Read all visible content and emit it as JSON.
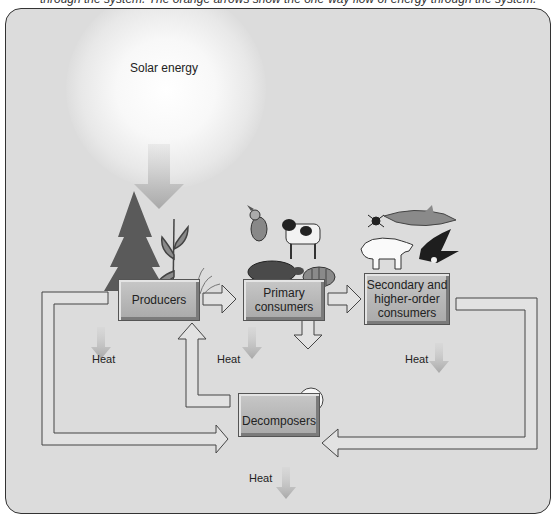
{
  "caption": "through the system. The orange arrows show the one-way flow of energy through the system.",
  "diagram": {
    "solar_label": "Solar energy",
    "nodes": {
      "producers": "Producers",
      "primary_line1": "Primary",
      "primary_line2": "consumers",
      "secondary_line1": "Secondary and",
      "secondary_line2": "higher-order",
      "secondary_line3": "consumers",
      "decomposers": "Decomposers"
    },
    "heat_labels": [
      "Heat",
      "Heat",
      "Heat",
      "Heat"
    ],
    "organisms": {
      "producers": [
        "tree-icon",
        "corn-plant-icon",
        "grass-icon"
      ],
      "primary_consumers": [
        "bird-icon",
        "cow-icon",
        "turtle-icon",
        "fish-icon"
      ],
      "secondary_consumers": [
        "spider-icon",
        "shark-icon",
        "polar-bear-icon",
        "eagle-icon"
      ],
      "decomposers": [
        "worm-icon",
        "mushroom-icon",
        "bacteria-icon"
      ]
    },
    "flows": [
      {
        "from": "solar",
        "to": "producers",
        "type": "energy"
      },
      {
        "from": "producers",
        "to": "primary_consumers",
        "type": "matter"
      },
      {
        "from": "primary_consumers",
        "to": "secondary_consumers",
        "type": "matter"
      },
      {
        "from": "primary_consumers",
        "to": "decomposers",
        "type": "matter"
      },
      {
        "from": "producers",
        "to": "decomposers",
        "type": "matter"
      },
      {
        "from": "secondary_consumers",
        "to": "decomposers",
        "type": "matter"
      },
      {
        "from": "decomposers",
        "to": "producers",
        "type": "matter"
      },
      {
        "from": "producers",
        "to": "heat",
        "type": "energy"
      },
      {
        "from": "primary_consumers",
        "to": "heat",
        "type": "energy"
      },
      {
        "from": "secondary_consumers",
        "to": "heat",
        "type": "energy"
      },
      {
        "from": "decomposers",
        "to": "heat",
        "type": "energy"
      }
    ]
  }
}
